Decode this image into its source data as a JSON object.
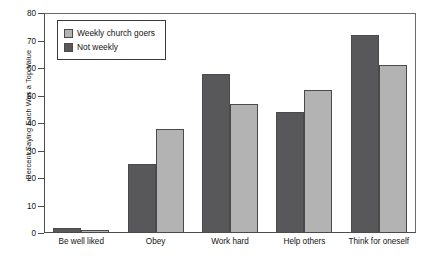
{
  "chart_data": {
    "type": "bar",
    "title": "",
    "xlabel": "",
    "ylabel": "Percent Saying Each Was a Top Value",
    "ylim": [
      0,
      80
    ],
    "yticks": [
      0,
      10,
      20,
      30,
      40,
      50,
      60,
      70,
      80
    ],
    "ytick_labels": [
      "0",
      "10",
      "20",
      "30",
      "40",
      "50",
      "60",
      "70",
      "80"
    ],
    "grid": false,
    "legend_position": "upper left",
    "categories": [
      "Be well liked",
      "Obey",
      "Work hard",
      "Help others",
      "Think for oneself"
    ],
    "series": [
      {
        "name": "Weekly church goers",
        "color": "#58585a",
        "values": [
          2,
          25,
          58,
          44,
          72
        ]
      },
      {
        "name": "Not weekly",
        "color": "#b3b3b3",
        "values": [
          1,
          38,
          47,
          52,
          61
        ]
      }
    ]
  },
  "legend": {
    "items": [
      {
        "label": "Weekly church goers"
      },
      {
        "label": "Not weekly"
      }
    ]
  },
  "colors": {
    "series_0": "#58585a",
    "series_1": "#b3b3b3",
    "axis": "#4d4d4d",
    "frame": "#6a6a6a",
    "text": "#141414",
    "background": "#ffffff"
  }
}
